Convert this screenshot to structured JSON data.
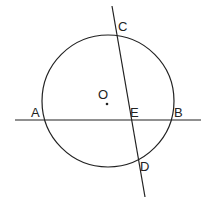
{
  "diagram": {
    "stroke_color": "#222222",
    "background": "#ffffff",
    "circle": {
      "name": "O",
      "cx": 108,
      "cy": 101,
      "r": 66
    },
    "center_dot": {
      "cx": 107,
      "cy": 104
    },
    "line_AB": {
      "x1": 15,
      "y1": 120,
      "x2": 201,
      "y2": 120
    },
    "line_CD": {
      "x1": 112,
      "y1": 6,
      "x2": 145,
      "y2": 197
    },
    "labels": {
      "A": "A",
      "B": "B",
      "C": "C",
      "D": "D",
      "E": "E",
      "O": "O"
    }
  }
}
